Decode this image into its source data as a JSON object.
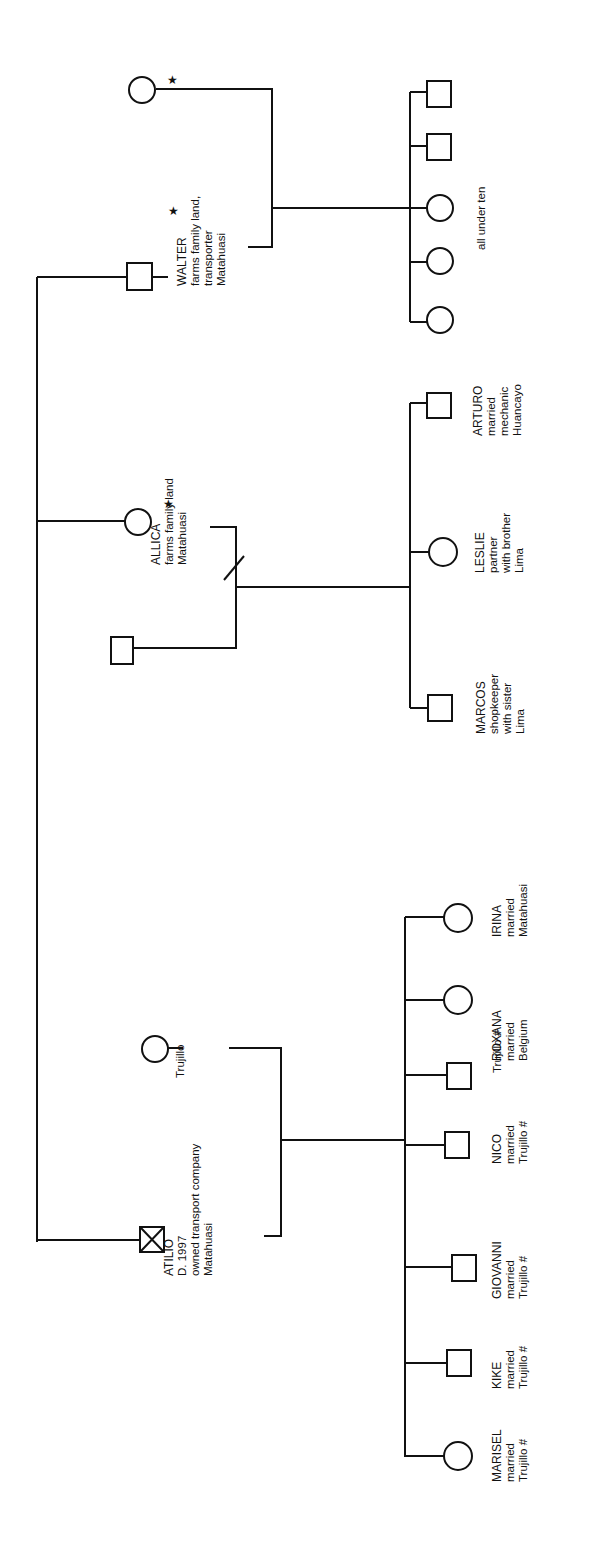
{
  "diagram": {
    "type": "kinship-genealogy",
    "orientation": "rotated-90-ccw",
    "star_glyph": "★",
    "families": [
      {
        "parent": {
          "name": "WALTER",
          "sex": "male",
          "starred": true,
          "lines": [
            "farms family land,",
            "transporter",
            "Matahuasi"
          ]
        },
        "spouse": {
          "sex": "female",
          "starred": true,
          "label": ""
        },
        "children_note": "all under ten",
        "children": [
          {
            "sex": "male"
          },
          {
            "sex": "male"
          },
          {
            "sex": "female"
          },
          {
            "sex": "female"
          },
          {
            "sex": "female"
          }
        ]
      },
      {
        "parent": {
          "name": "ALLICA",
          "sex": "female",
          "starred": true,
          "lines": [
            "farms family land",
            "Matahuasi"
          ]
        },
        "spouse": {
          "sex": "male",
          "starred": false,
          "label": "",
          "separated": true
        },
        "children": [
          {
            "name": "ARTURO",
            "sex": "male",
            "lines": [
              "married",
              "mechanic",
              "Huancayo"
            ]
          },
          {
            "name": "LESLIE",
            "sex": "female",
            "lines": [
              "partner",
              "with brother",
              "Lima"
            ]
          },
          {
            "name": "MARCOS",
            "sex": "male",
            "lines": [
              "shopkeeper",
              "with sister",
              "Lima"
            ]
          }
        ]
      },
      {
        "parent": {
          "name": "ATILIO",
          "sex": "male",
          "deceased": true,
          "lines": [
            "D. 1997",
            "owned transport company",
            "Matahuasi"
          ]
        },
        "spouse": {
          "sex": "female",
          "label": "Trujillo"
        },
        "children": [
          {
            "name": "IRINA",
            "sex": "female",
            "lines": [
              "married",
              "Matahuasi"
            ]
          },
          {
            "name": "ROXANA",
            "sex": "female",
            "lines": [
              "married",
              "Belgium"
            ]
          },
          {
            "name": "Trujillo #",
            "sex": "male",
            "lines": []
          },
          {
            "name": "NICO",
            "sex": "male",
            "lines": [
              "married",
              "Trujillo #"
            ]
          },
          {
            "name": "GIOVANNI",
            "sex": "male",
            "lines": [
              "married",
              "Trujillo #"
            ]
          },
          {
            "name": "KIKE",
            "sex": "male",
            "lines": [
              "married",
              "Trujillo #"
            ]
          },
          {
            "name": "MARISEL",
            "sex": "female",
            "lines": [
              "married",
              "Trujillo #"
            ]
          }
        ]
      }
    ]
  }
}
